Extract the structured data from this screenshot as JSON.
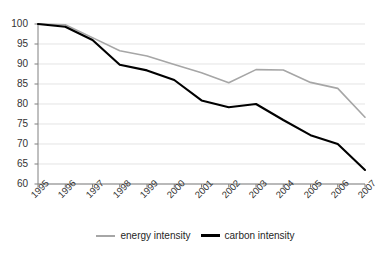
{
  "chart_data": {
    "type": "line",
    "title": "",
    "subtitle": "",
    "xlabel": "",
    "ylabel": "",
    "grid": true,
    "legend_position": "bottom",
    "categories": [
      "1995",
      "1996",
      "1997",
      "1998",
      "1999",
      "2000",
      "2001",
      "2002",
      "2003",
      "2004",
      "2005",
      "2006",
      "2007"
    ],
    "x": [
      1995,
      1996,
      1997,
      1998,
      1999,
      2000,
      2001,
      2002,
      2003,
      2004,
      2005,
      2006,
      2007
    ],
    "xlim": [
      1995,
      2007
    ],
    "ylim": [
      60,
      100
    ],
    "ytick_labels": [
      "100",
      "95",
      "90",
      "85",
      "80",
      "75",
      "70",
      "65",
      "60"
    ],
    "yticks": [
      100,
      95,
      90,
      85,
      80,
      75,
      70,
      65,
      60
    ],
    "series": [
      {
        "name": "energy intensity",
        "color": "#a6a6a6",
        "values": [
          100.0,
          99.8,
          96.6,
          93.3,
          92.0,
          89.9,
          87.8,
          85.3,
          88.6,
          88.5,
          85.4,
          83.9,
          76.7
        ]
      },
      {
        "name": "carbon intensity",
        "color": "#000000",
        "values": [
          100.0,
          99.3,
          96.0,
          89.8,
          88.4,
          86.0,
          80.9,
          79.2,
          80.0,
          76.0,
          72.2,
          70.0,
          63.5
        ]
      }
    ]
  },
  "legend": {
    "entries": [
      {
        "label": "energy intensity",
        "color": "#a6a6a6"
      },
      {
        "label": "carbon intensity",
        "color": "#000000"
      }
    ]
  },
  "axes": {
    "y_axis_name": "y-axis",
    "x_axis_name": "x-axis"
  }
}
